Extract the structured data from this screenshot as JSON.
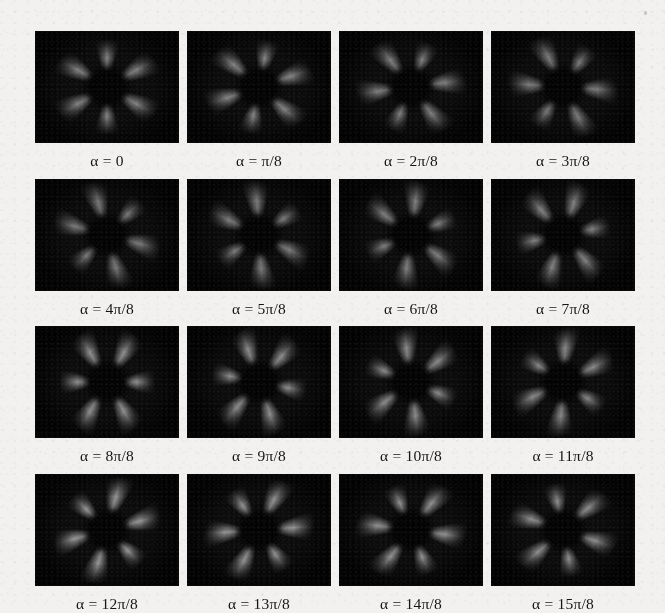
{
  "figure": {
    "type": "image-grid",
    "rows": 4,
    "columns": 4,
    "panel_count": 16,
    "background_color": "#f2f1ef",
    "panel_background_color": "#050505",
    "caption_color": "#151515",
    "symbol": "α",
    "equals": "=",
    "panels": [
      {
        "label": "α = 0",
        "alpha_numerator": 0,
        "alpha_denominator": 8,
        "rotation_deg": 0,
        "row": 1,
        "col": 1,
        "lobes": 6,
        "brightness": 0.78
      },
      {
        "label": "α = π/8",
        "alpha_numerator": 1,
        "alpha_denominator": 8,
        "rotation_deg": 11.25,
        "row": 1,
        "col": 2,
        "lobes": 6,
        "brightness": 0.8
      },
      {
        "label": "α = 2π/8",
        "alpha_numerator": 2,
        "alpha_denominator": 8,
        "rotation_deg": 22.5,
        "row": 1,
        "col": 3,
        "lobes": 6,
        "brightness": 0.76
      },
      {
        "label": "α = 3π/8",
        "alpha_numerator": 3,
        "alpha_denominator": 8,
        "rotation_deg": 33.75,
        "row": 1,
        "col": 4,
        "lobes": 6,
        "brightness": 0.74
      },
      {
        "label": "α = 4π/8",
        "alpha_numerator": 4,
        "alpha_denominator": 8,
        "rotation_deg": 45,
        "row": 2,
        "col": 1,
        "lobes": 6,
        "brightness": 0.72
      },
      {
        "label": "α = 5π/8",
        "alpha_numerator": 5,
        "alpha_denominator": 8,
        "rotation_deg": 56.25,
        "row": 2,
        "col": 2,
        "lobes": 6,
        "brightness": 0.74
      },
      {
        "label": "α = 6π/8",
        "alpha_numerator": 6,
        "alpha_denominator": 8,
        "rotation_deg": 67.5,
        "row": 2,
        "col": 3,
        "lobes": 6,
        "brightness": 0.76
      },
      {
        "label": "α = 7π/8",
        "alpha_numerator": 7,
        "alpha_denominator": 8,
        "rotation_deg": 78.75,
        "row": 2,
        "col": 4,
        "lobes": 6,
        "brightness": 0.78
      },
      {
        "label": "α = 8π/8",
        "alpha_numerator": 8,
        "alpha_denominator": 8,
        "rotation_deg": 90,
        "row": 3,
        "col": 1,
        "lobes": 6,
        "brightness": 0.88
      },
      {
        "label": "α = 9π/8",
        "alpha_numerator": 9,
        "alpha_denominator": 8,
        "rotation_deg": 101.25,
        "row": 3,
        "col": 2,
        "lobes": 6,
        "brightness": 0.86
      },
      {
        "label": "α = 10π/8",
        "alpha_numerator": 10,
        "alpha_denominator": 8,
        "rotation_deg": 112.5,
        "row": 3,
        "col": 3,
        "lobes": 6,
        "brightness": 0.84
      },
      {
        "label": "α = 11π/8",
        "alpha_numerator": 11,
        "alpha_denominator": 8,
        "rotation_deg": 123.75,
        "row": 3,
        "col": 4,
        "lobes": 6,
        "brightness": 0.82
      },
      {
        "label": "α = 12π/8",
        "alpha_numerator": 12,
        "alpha_denominator": 8,
        "rotation_deg": 135,
        "row": 4,
        "col": 1,
        "lobes": 6,
        "brightness": 0.92
      },
      {
        "label": "α = 13π/8",
        "alpha_numerator": 13,
        "alpha_denominator": 8,
        "rotation_deg": 146.25,
        "row": 4,
        "col": 2,
        "lobes": 6,
        "brightness": 0.9
      },
      {
        "label": "α = 14π/8",
        "alpha_numerator": 14,
        "alpha_denominator": 8,
        "rotation_deg": 157.5,
        "row": 4,
        "col": 3,
        "lobes": 6,
        "brightness": 0.88
      },
      {
        "label": "α = 15π/8",
        "alpha_numerator": 15,
        "alpha_denominator": 8,
        "rotation_deg": 168.75,
        "row": 4,
        "col": 4,
        "lobes": 6,
        "brightness": 0.86
      }
    ]
  }
}
